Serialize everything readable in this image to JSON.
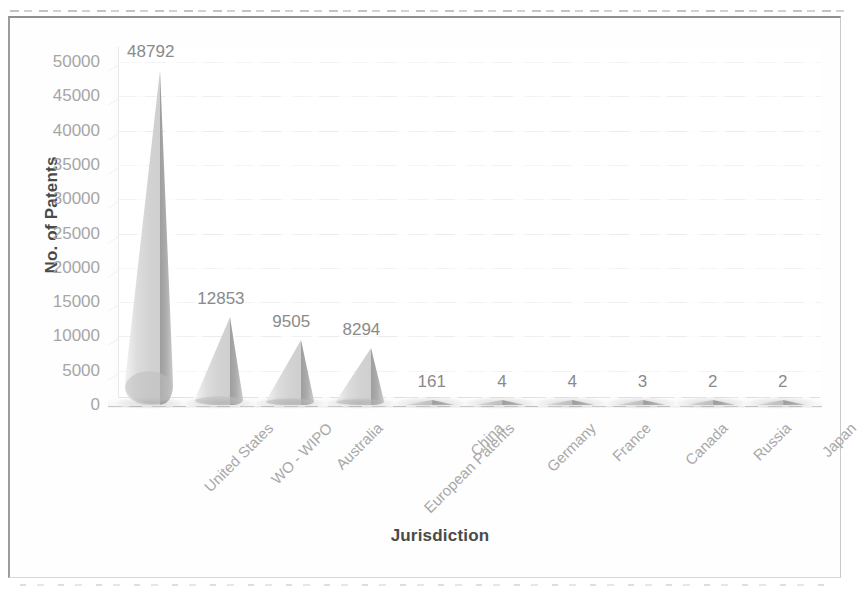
{
  "chart_data": {
    "type": "bar",
    "title": "",
    "subtitle": "",
    "xlabel": "Jurisdiction",
    "ylabel": "No. of Patents",
    "categories": [
      "United States",
      "WO - WIPO",
      "Australia",
      "European Patents",
      "China",
      "Germany",
      "France",
      "Canada",
      "Russia",
      "Japan"
    ],
    "values": [
      48792,
      12853,
      9505,
      8294,
      161,
      4,
      4,
      3,
      2,
      2
    ],
    "data_labels": [
      "48792",
      "12853",
      "9505",
      "8294",
      "161",
      "4",
      "4",
      "3",
      "2",
      "2"
    ],
    "ylim": [
      0,
      50000
    ],
    "ytick_labels": [
      "50000",
      "45000",
      "40000",
      "35000",
      "30000",
      "25000",
      "20000",
      "15000",
      "10000",
      "5000",
      "0"
    ],
    "ytick_values": [
      50000,
      45000,
      40000,
      35000,
      30000,
      25000,
      20000,
      15000,
      10000,
      5000,
      0
    ],
    "ytick_step": 5000,
    "grid": true,
    "legend": false,
    "legend_position": "none",
    "render_style": "3d-cone",
    "series": [
      {
        "name": "No. of Patents",
        "values": [
          48792,
          12853,
          9505,
          8294,
          161,
          4,
          4,
          3,
          2,
          2
        ]
      }
    ],
    "colors": {
      "cone_light": "#dcdcdc",
      "cone_dark": "#a0a0a0",
      "gridline": "#ededed",
      "axis_text": "#a6a6a6",
      "axis_title": "#4a4a4a",
      "data_label": "#8a8a8a",
      "frame": "#9c9c9c",
      "background": "#ffffff"
    }
  }
}
